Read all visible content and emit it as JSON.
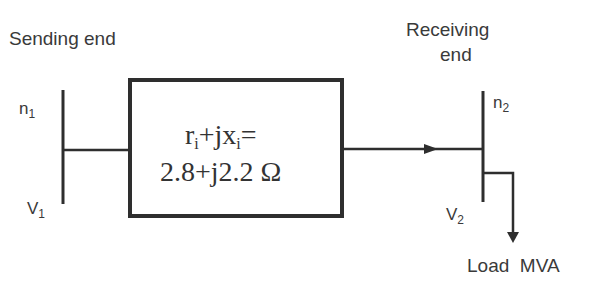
{
  "labels": {
    "sending_end": "Sending end",
    "receiving_end_line1": "Receiving",
    "receiving_end_line2": "end",
    "node1": "n",
    "node1_sub": "1",
    "node2": "n",
    "node2_sub": "2",
    "voltage1": "V",
    "voltage1_sub": "1",
    "voltage2": "V",
    "voltage2_sub": "2",
    "load": "Load  MVA"
  },
  "impedance_box": {
    "line1_r": "r",
    "line1_r_sub": "i",
    "line1_plus_jx": "+jx",
    "line1_x_sub": "i",
    "line1_eq": "=",
    "line2": "2.8+j2.2 Ω"
  },
  "colors": {
    "line": "#2e2e2e",
    "text": "#3a3a3a",
    "background": "#ffffff"
  }
}
